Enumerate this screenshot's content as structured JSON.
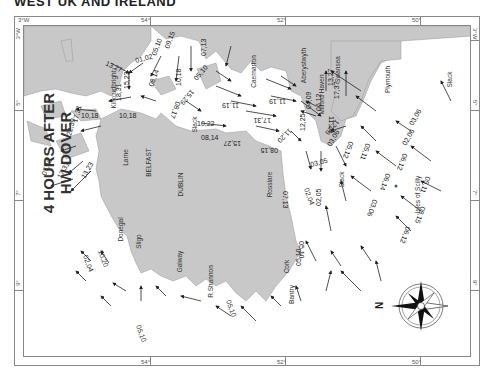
{
  "header": {
    "title": "WEST UK AND IRELAND"
  },
  "map": {
    "heading_line1": "4 HOURS AFTER",
    "heading_line2": "HW DOVER",
    "colors": {
      "land": "#c8c8c8",
      "sea": "#ffffff",
      "coast": "#999999",
      "arrow": "#222222"
    },
    "border_ticks": {
      "top": [
        "3°W",
        "54°",
        "52°",
        "50°",
        "3°W"
      ],
      "right": [
        "3°W",
        "5°",
        "7°",
        "9°"
      ],
      "bottom": [
        "54°",
        "52°",
        "50°"
      ],
      "left": [
        "3°W",
        "5°",
        "7°",
        "9°"
      ]
    },
    "places": {
      "kirkcudbright": "Kirkcudbright",
      "caernarfon": "Caernarfon",
      "aberystwyth": "Aberystwyth",
      "milford_haven": "Milford Haven",
      "swansea": "Swansea",
      "plymouth": "Plymouth",
      "larne": "Larne",
      "belfast": "BELFAST",
      "dublin": "DUBLIN",
      "rosslare": "Rosslare",
      "donegal": "Donegal",
      "sligo": "Sligo",
      "galway": "Galway",
      "shannon": "R.Shannon",
      "cork": "Cork",
      "bantry": "Bantry",
      "scilly": "Isles of Scilly"
    },
    "slack_labels": [
      "Slack",
      "Slack",
      "Slack",
      "Slack"
    ],
    "rates": {
      "r1": "13,27",
      "r2": "01,02",
      "r3": "05,10",
      "r4": "09,15",
      "r5": "07,13",
      "r6": "18,31",
      "r7": "15,23",
      "r8": "08,14",
      "r9": "10,18",
      "r10": "05,10",
      "r11": "10,18",
      "r12": "10,18",
      "r13": "15,29",
      "r14": "08,17",
      "r15": "22,39",
      "r16": "17,31",
      "r17": "11,19",
      "r18": "11,19",
      "r19": "10,22",
      "r20": "17,31",
      "r21": "08,14",
      "r22": "15,27",
      "r23": "08,15",
      "r24": "11,20",
      "r25": "07,13",
      "r26": "02,04",
      "r27": "07,13",
      "r28": "17,31",
      "r29": "13,23",
      "r30": "04,09",
      "r31": "12,25",
      "r32": "06,12",
      "r33": "11,20",
      "r34": "12,26",
      "r35": "13,27",
      "r36": "17,37",
      "r37": "03,05",
      "r38": "03,06",
      "r39": "05,12",
      "r40": "03,06",
      "r41": "06,12",
      "r42": "05,11",
      "r43": "06,14",
      "r44": "02,05",
      "r45": "08,15",
      "r46": "06,12",
      "r47": "05,11",
      "r48": "02,06",
      "r49": "03,06",
      "r50": "05,10",
      "r51": "05,10",
      "r52": "10,20",
      "r53": "02,04",
      "r54": "05,10",
      "r55": "05,10"
    },
    "compass": {
      "north_label": "N"
    }
  }
}
